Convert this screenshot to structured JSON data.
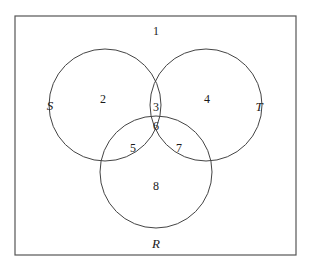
{
  "figure": {
    "type": "venn-diagram",
    "sets_count": 3,
    "border_color": "#555555",
    "circle_color": "#444444",
    "text_color": "#1a1a1a",
    "background_color": "#ffffff"
  },
  "universe": {
    "name": "universal-set-rectangle",
    "x": 15,
    "y": 16,
    "width": 281,
    "height": 239
  },
  "circles": [
    {
      "id": "S",
      "cx": 105,
      "cy": 105,
      "r": 56
    },
    {
      "id": "T",
      "cx": 206,
      "cy": 105,
      "r": 56
    },
    {
      "id": "R",
      "cx": 156,
      "cy": 172,
      "r": 56
    }
  ],
  "set_labels": [
    {
      "name": "set-label-S",
      "text": "S",
      "x": 50,
      "y": 105
    },
    {
      "name": "set-label-T",
      "text": "T",
      "x": 259,
      "y": 106
    },
    {
      "name": "set-label-R",
      "text": "R",
      "x": 156,
      "y": 243
    }
  ],
  "region_labels": [
    {
      "name": "region-label-1",
      "text": "1",
      "x": 156,
      "y": 31,
      "region": "outside-all"
    },
    {
      "name": "region-label-2",
      "text": "2",
      "x": 103,
      "y": 99,
      "region": "S-only"
    },
    {
      "name": "region-label-3",
      "text": "3",
      "x": 156,
      "y": 107,
      "region": "S-and-T"
    },
    {
      "name": "region-label-4",
      "text": "4",
      "x": 207,
      "y": 99,
      "region": "T-only"
    },
    {
      "name": "region-label-5",
      "text": "5",
      "x": 133,
      "y": 148,
      "region": "S-and-R"
    },
    {
      "name": "region-label-6",
      "text": "6",
      "x": 156,
      "y": 126,
      "region": "S-and-T-and-R"
    },
    {
      "name": "region-label-7",
      "text": "7",
      "x": 179,
      "y": 148,
      "region": "T-and-R"
    },
    {
      "name": "region-label-8",
      "text": "8",
      "x": 156,
      "y": 186,
      "region": "R-only"
    }
  ]
}
